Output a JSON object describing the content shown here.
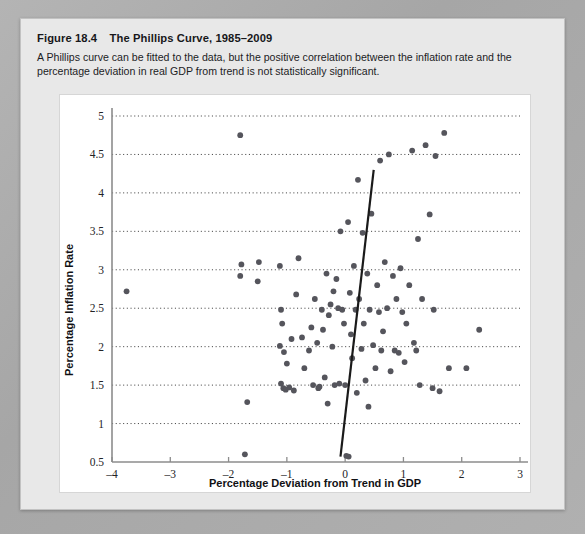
{
  "figure": {
    "number": "Figure 18.4",
    "title": "The Phillips Curve, 1985–2009",
    "description": "A Phillips curve can be fitted to the data, but the positive correlation between the inflation rate and the percentage deviation in real GDP from trend is not statistically significant."
  },
  "colors": {
    "page_background": "#a8a8a8",
    "card_background": "#e8e8e8",
    "plot_background": "#ffffff",
    "point": "#55555c",
    "line": "#1a1a1a",
    "grid": "#4a4a4a",
    "axis": "#8c8c8c"
  },
  "chart_data": {
    "type": "scatter",
    "title": "The Phillips Curve, 1985–2009",
    "xlabel": "Percentage Deviation from Trend in GDP",
    "ylabel": "Percentage Inflation Rate",
    "xlim": [
      -4,
      3
    ],
    "ylim": [
      0.5,
      5
    ],
    "xticks": [
      -4,
      -3,
      -2,
      -1,
      0,
      1,
      2,
      3
    ],
    "xtick_labels": [
      "–4",
      "–3",
      "–2",
      "–1",
      "0",
      "1",
      "2",
      "3"
    ],
    "yticks": [
      0.5,
      1,
      1.5,
      2,
      2.5,
      3,
      3.5,
      4,
      4.5,
      5
    ],
    "ytick_labels": [
      "0.5",
      "1",
      "1.5",
      "2",
      "2.5",
      "3",
      "3.5",
      "4",
      "4.5",
      "5"
    ],
    "grid": "horizontal-dotted",
    "legend": "none",
    "series": [
      {
        "name": "Inflation vs GDP deviation",
        "marker": "circle",
        "points": [
          [
            -3.75,
            2.72
          ],
          [
            -1.8,
            4.75
          ],
          [
            -1.78,
            3.07
          ],
          [
            -1.8,
            2.92
          ],
          [
            -1.68,
            1.28
          ],
          [
            -1.72,
            0.6
          ],
          [
            -1.48,
            3.1
          ],
          [
            -1.5,
            2.85
          ],
          [
            -1.12,
            3.05
          ],
          [
            -1.1,
            2.48
          ],
          [
            -1.08,
            2.3
          ],
          [
            -1.12,
            2.01
          ],
          [
            -1.05,
            1.93
          ],
          [
            -1.0,
            1.78
          ],
          [
            -1.1,
            1.52
          ],
          [
            -1.06,
            1.46
          ],
          [
            -1.02,
            1.44
          ],
          [
            -0.96,
            1.47
          ],
          [
            -0.88,
            1.43
          ],
          [
            -0.92,
            2.1
          ],
          [
            -0.84,
            2.68
          ],
          [
            -0.8,
            3.15
          ],
          [
            -0.74,
            2.12
          ],
          [
            -0.7,
            1.72
          ],
          [
            -0.62,
            1.95
          ],
          [
            -0.58,
            2.25
          ],
          [
            -0.55,
            1.5
          ],
          [
            -0.52,
            2.62
          ],
          [
            -0.48,
            2.05
          ],
          [
            -0.46,
            1.46
          ],
          [
            -0.44,
            1.48
          ],
          [
            -0.4,
            2.48
          ],
          [
            -0.38,
            2.22
          ],
          [
            -0.35,
            1.6
          ],
          [
            -0.32,
            2.95
          ],
          [
            -0.3,
            1.26
          ],
          [
            -0.28,
            2.41
          ],
          [
            -0.25,
            2.55
          ],
          [
            -0.22,
            2.0
          ],
          [
            -0.2,
            2.72
          ],
          [
            -0.18,
            1.5
          ],
          [
            -0.15,
            2.88
          ],
          [
            -0.12,
            2.5
          ],
          [
            -0.1,
            1.52
          ],
          [
            -0.08,
            3.5
          ],
          [
            -0.05,
            2.48
          ],
          [
            -0.02,
            2.3
          ],
          [
            0.0,
            1.5
          ],
          [
            0.02,
            0.58
          ],
          [
            0.06,
            0.57
          ],
          [
            0.05,
            3.62
          ],
          [
            0.08,
            2.7
          ],
          [
            0.1,
            2.16
          ],
          [
            0.12,
            1.85
          ],
          [
            0.15,
            3.05
          ],
          [
            0.18,
            2.48
          ],
          [
            0.2,
            1.4
          ],
          [
            0.22,
            4.17
          ],
          [
            0.24,
            2.62
          ],
          [
            0.28,
            1.97
          ],
          [
            0.3,
            3.48
          ],
          [
            0.32,
            2.3
          ],
          [
            0.35,
            1.56
          ],
          [
            0.38,
            2.95
          ],
          [
            0.4,
            1.22
          ],
          [
            0.42,
            2.48
          ],
          [
            0.45,
            3.73
          ],
          [
            0.48,
            2.02
          ],
          [
            0.52,
            1.72
          ],
          [
            0.55,
            2.8
          ],
          [
            0.58,
            2.45
          ],
          [
            0.6,
            4.42
          ],
          [
            0.62,
            1.95
          ],
          [
            0.65,
            2.2
          ],
          [
            0.68,
            3.1
          ],
          [
            0.72,
            2.5
          ],
          [
            0.75,
            4.5
          ],
          [
            0.78,
            1.68
          ],
          [
            0.82,
            2.92
          ],
          [
            0.85,
            1.95
          ],
          [
            0.88,
            2.62
          ],
          [
            0.92,
            1.92
          ],
          [
            0.95,
            3.02
          ],
          [
            0.98,
            2.45
          ],
          [
            1.02,
            1.8
          ],
          [
            1.05,
            2.3
          ],
          [
            1.1,
            2.8
          ],
          [
            1.15,
            4.55
          ],
          [
            1.18,
            2.05
          ],
          [
            1.22,
            1.95
          ],
          [
            1.25,
            3.4
          ],
          [
            1.28,
            1.5
          ],
          [
            1.32,
            2.62
          ],
          [
            1.38,
            4.62
          ],
          [
            1.45,
            3.72
          ],
          [
            1.5,
            1.46
          ],
          [
            1.52,
            2.48
          ],
          [
            1.55,
            4.48
          ],
          [
            1.62,
            1.42
          ],
          [
            1.7,
            4.78
          ],
          [
            1.78,
            1.72
          ],
          [
            2.08,
            1.72
          ],
          [
            2.3,
            2.22
          ]
        ]
      }
    ],
    "fit_line": {
      "label": "fitted Phillips curve",
      "x_start": -0.08,
      "y_start": 0.57,
      "x_end": 0.49,
      "y_end": 4.3
    }
  }
}
